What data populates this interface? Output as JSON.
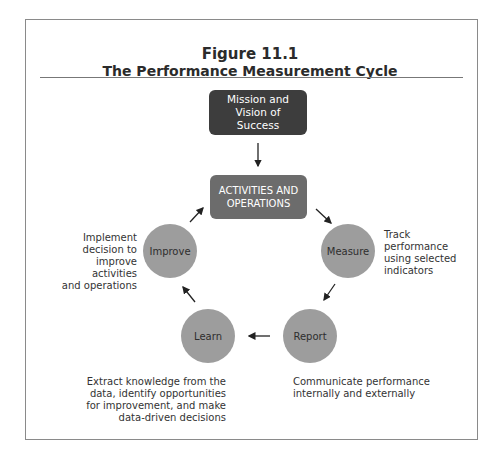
{
  "clipped_top_text": "clipped text (only descenders visible)",
  "figure": {
    "number": "Figure 11.1",
    "title": "The Performance Measurement Cycle"
  },
  "nodes": {
    "mission": "Mission and Vision of Success",
    "activities": "ACTIVITIES AND OPERATIONS",
    "measure": "Measure",
    "report": "Report",
    "learn": "Learn",
    "improve": "Improve"
  },
  "descriptions": {
    "improve": "Implement\ndecision to\nimprove activities\nand operations",
    "measure": "Track\nperformance\nusing selected\nindicators",
    "learn": "Extract knowledge from the\ndata, identify opportunities\nfor improvement, and make\ndata-driven decisions",
    "report": "Communicate performance\ninternally and externally"
  },
  "edges": [
    {
      "from": "mission",
      "to": "activities"
    },
    {
      "from": "activities",
      "to": "measure"
    },
    {
      "from": "measure",
      "to": "report"
    },
    {
      "from": "report",
      "to": "learn"
    },
    {
      "from": "learn",
      "to": "improve"
    },
    {
      "from": "improve",
      "to": "activities"
    }
  ],
  "colors": {
    "mission_box": "#3d3d3d",
    "activities_box": "#6c6c6c",
    "circle": "#9d9d9d",
    "frame": "#8a8a8a"
  }
}
